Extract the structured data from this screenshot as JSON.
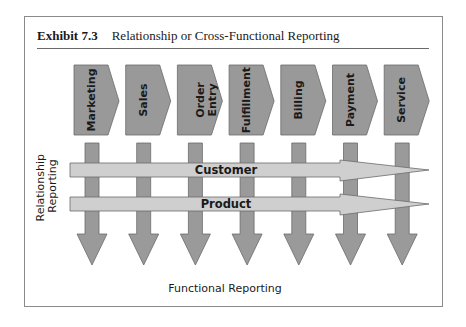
{
  "exhibit": {
    "number_label": "Exhibit 7.3",
    "title": "Relationship or Cross-Functional Reporting"
  },
  "functions": [
    {
      "lines": [
        "Marketing"
      ]
    },
    {
      "lines": [
        "Sales"
      ]
    },
    {
      "lines": [
        "Order",
        "Entry"
      ]
    },
    {
      "lines": [
        "Fulfillment"
      ]
    },
    {
      "lines": [
        "Billing"
      ]
    },
    {
      "lines": [
        "Payment"
      ]
    },
    {
      "lines": [
        "Service"
      ]
    }
  ],
  "relationships": [
    {
      "label": "Customer"
    },
    {
      "label": "Product"
    }
  ],
  "axes": {
    "vertical_label_lines": [
      "Relationship",
      "Reporting"
    ],
    "horizontal_label": "Functional Reporting"
  },
  "colors": {
    "function_box": "#999999",
    "down_arrow": "#9a9a9a",
    "band_arrow": "#cfcfcf",
    "outline": "#6b6b6b",
    "frame": "#8a8a8a"
  }
}
